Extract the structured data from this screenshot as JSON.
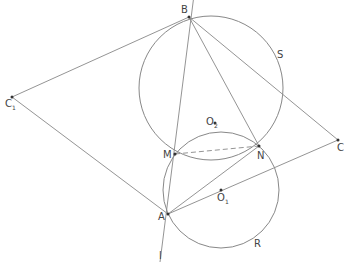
{
  "diagram": {
    "type": "geometry",
    "stroke_color": "#888888",
    "label_color": "#444444",
    "points": [
      {
        "id": "B",
        "label": "B",
        "x": 189,
        "y": 17,
        "lx": 181,
        "ly": 5
      },
      {
        "id": "C",
        "label": "C",
        "x": 338,
        "y": 140,
        "lx": 337,
        "ly": 143
      },
      {
        "id": "C1",
        "label": "C",
        "sub": "1",
        "x": 12,
        "y": 97,
        "lx": 5,
        "ly": 99
      },
      {
        "id": "M",
        "label": "M",
        "x": 175,
        "y": 154,
        "lx": 163,
        "ly": 150
      },
      {
        "id": "N",
        "label": "N",
        "x": 259,
        "y": 146,
        "lx": 257,
        "ly": 151
      },
      {
        "id": "A",
        "label": "A",
        "x": 168,
        "y": 214,
        "lx": 158,
        "ly": 212
      },
      {
        "id": "O2",
        "label": "O",
        "sub": "2",
        "x": 215,
        "y": 123,
        "lx": 206,
        "ly": 117
      },
      {
        "id": "O1",
        "label": "O",
        "sub": "1",
        "x": 221,
        "y": 190,
        "lx": 217,
        "ly": 193
      }
    ],
    "other_labels": [
      {
        "text": "S",
        "x": 277,
        "y": 50
      },
      {
        "text": "R",
        "x": 254,
        "y": 239
      },
      {
        "text": "l",
        "x": 159,
        "y": 251
      }
    ],
    "circles": [
      {
        "name": "circle-S",
        "cx": 211,
        "cy": 88,
        "r": 72
      },
      {
        "name": "circle-R",
        "cx": 221,
        "cy": 190,
        "r": 58
      }
    ],
    "segments": [
      {
        "name": "line-l",
        "x1": 194,
        "y1": -5,
        "x2": 160,
        "y2": 262
      },
      {
        "name": "seg-B-C1",
        "x1": 189,
        "y1": 17,
        "x2": 12,
        "y2": 97
      },
      {
        "name": "seg-C1-A",
        "x1": 12,
        "y1": 97,
        "x2": 168,
        "y2": 214
      },
      {
        "name": "seg-B-C",
        "x1": 189,
        "y1": 17,
        "x2": 338,
        "y2": 140
      },
      {
        "name": "seg-B-N",
        "x1": 189,
        "y1": 17,
        "x2": 259,
        "y2": 146
      },
      {
        "name": "seg-A-N",
        "x1": 168,
        "y1": 214,
        "x2": 259,
        "y2": 146
      },
      {
        "name": "seg-A-C",
        "x1": 168,
        "y1": 214,
        "x2": 338,
        "y2": 140
      }
    ],
    "dashed": [
      {
        "name": "seg-M-N",
        "x1": 175,
        "y1": 154,
        "x2": 259,
        "y2": 146
      }
    ]
  }
}
